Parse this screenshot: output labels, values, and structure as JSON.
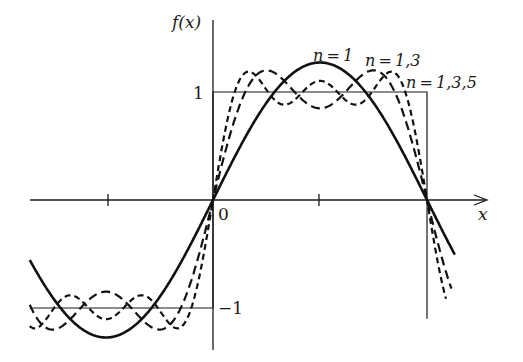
{
  "chart_data": {
    "type": "line",
    "title": "",
    "xlabel": "x",
    "ylabel": "f(x)",
    "origin_label": "0",
    "y_tick_labels": [
      "1",
      "-1"
    ],
    "y_ticks": [
      1,
      -1
    ],
    "x_ticks_rad": [
      -1.5708,
      1.5708,
      3.1416
    ],
    "xlim_rad": [
      -2.69,
      3.55
    ],
    "ylim": [
      -1.45,
      1.5
    ],
    "grid": false,
    "legend_position": "inline labels near curves (top right)",
    "target_function": {
      "name": "square wave",
      "pieces": [
        {
          "x_from": -3.1416,
          "x_to": 0,
          "y": -1
        },
        {
          "x_from": 0,
          "x_to": 3.1416,
          "y": 1
        }
      ]
    },
    "series": [
      {
        "name": "n=1",
        "label": "n=1",
        "terms": [
          1
        ],
        "style": "solid",
        "peak": 1.273
      },
      {
        "name": "n=1,3",
        "label": "n=1,3",
        "terms": [
          1,
          3
        ],
        "style": "dashed",
        "peak": 1.2
      },
      {
        "name": "n=1,3,5",
        "label": "n=1,3,5",
        "terms": [
          1,
          3,
          5
        ],
        "style": "dotted-dashed",
        "peak": 1.18
      }
    ]
  },
  "labels": {
    "y_axis": "f(x)",
    "x_axis": "x",
    "origin": "0",
    "one": "1",
    "minus_one": "−1",
    "n1": "n = 1",
    "n13": "n = 1,3",
    "n135": "n = 1,3,5"
  }
}
